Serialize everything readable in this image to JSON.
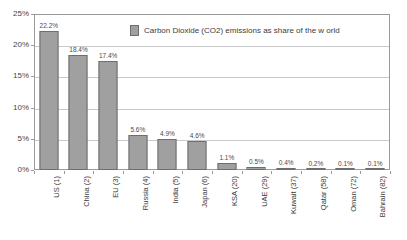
{
  "chart_data": {
    "type": "bar",
    "title": "",
    "subtitle": "",
    "xlabel": "",
    "ylabel": "",
    "ylim": [
      0,
      25
    ],
    "y_tick_labels": [
      "0%",
      "5%",
      "10%",
      "15%",
      "20%",
      "25%"
    ],
    "y_tick_values": [
      0,
      5,
      10,
      15,
      20,
      25
    ],
    "grid": true,
    "legend_position": "top-center",
    "legend": [
      "Carbon Dioxide (CO2) emissions as share of the w orld"
    ],
    "categories": [
      "US (1)",
      "China (2)",
      "EU (3)",
      "Russia (4)",
      "India (5)",
      "Japan (6)",
      "KSA (20)",
      "UAE (29)",
      "Kuwait (37)",
      "Qatar (58)",
      "Oman (72)",
      "Bahrain (82)"
    ],
    "values": [
      22.2,
      18.4,
      17.4,
      5.6,
      4.9,
      4.6,
      1.1,
      0.5,
      0.4,
      0.2,
      0.1,
      0.1
    ],
    "data_labels": [
      "22.2%",
      "18.4%",
      "17.4%",
      "5.6%",
      "4.9%",
      "4.6%",
      "1.1%",
      "0.5%",
      "0.4%",
      "0.2%",
      "0.1%",
      "0.1%"
    ],
    "series": [
      {
        "name": "Carbon Dioxide (CO2) emissions as share of the w orld",
        "values": [
          22.2,
          18.4,
          17.4,
          5.6,
          4.9,
          4.6,
          1.1,
          0.5,
          0.4,
          0.2,
          0.1,
          0.1
        ]
      }
    ]
  },
  "colors": {
    "bar_fill": "#a0a0a0",
    "bar_border": "#6e6e6e",
    "gridline": "#c9c9c9",
    "plot_border": "#9a9a9a",
    "text": "#3d3d3d",
    "background": "#ffffff"
  },
  "legend": {
    "label": "Carbon Dioxide (CO2) emissions as share of the w orld"
  }
}
